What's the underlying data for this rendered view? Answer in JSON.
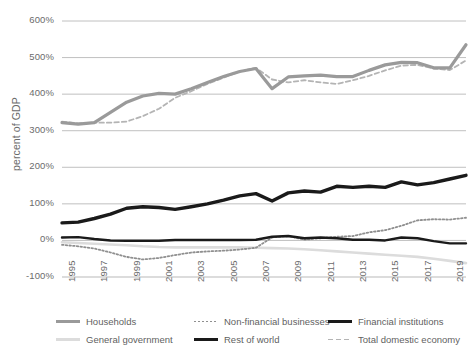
{
  "chart_data": {
    "type": "line",
    "title": "",
    "xlabel": "",
    "ylabel": "percent of GDP",
    "ylim": [
      -100,
      600
    ],
    "xlim": [
      1995,
      2020
    ],
    "grid": true,
    "legend_position": "bottom",
    "ytick_labels": [
      "600%",
      "500%",
      "400%",
      "300%",
      "200%",
      "100%",
      "0%",
      "-100%"
    ],
    "ytick_values": [
      600,
      500,
      400,
      300,
      200,
      100,
      0,
      -100
    ],
    "xtick_labels": [
      "1995",
      "1997",
      "1999",
      "2001",
      "2003",
      "2005",
      "2007",
      "2009",
      "2011",
      "2013",
      "2015",
      "2017",
      "2019"
    ],
    "xtick_values": [
      1995,
      1997,
      1999,
      2001,
      2003,
      2005,
      2007,
      2009,
      2011,
      2013,
      2015,
      2017,
      2019
    ],
    "x": [
      1995,
      1996,
      1997,
      1998,
      1999,
      2000,
      2001,
      2002,
      2003,
      2004,
      2005,
      2006,
      2007,
      2008,
      2009,
      2010,
      2011,
      2012,
      2013,
      2014,
      2015,
      2016,
      2017,
      2018,
      2019,
      2020
    ],
    "series": [
      {
        "name": "Households",
        "color": "#9a9a9a",
        "style": "solid",
        "width": 3.2,
        "values": [
          322,
          318,
          322,
          350,
          378,
          395,
          402,
          400,
          415,
          432,
          448,
          462,
          470,
          415,
          447,
          450,
          452,
          448,
          448,
          465,
          480,
          487,
          486,
          472,
          472,
          535
        ]
      },
      {
        "name": "General government",
        "color": "#dcdcdc",
        "style": "solid",
        "width": 2.6,
        "values": [
          -5,
          -7,
          -9,
          -11,
          -13,
          -16,
          -18,
          -19,
          -19,
          -19,
          -19,
          -19,
          -20,
          -21,
          -22,
          -24,
          -27,
          -30,
          -33,
          -36,
          -39,
          -42,
          -45,
          -50,
          -56,
          -62
        ]
      },
      {
        "name": "Non-financial businesses",
        "color": "#8f8f8f",
        "style": "dotted",
        "width": 1.8,
        "values": [
          -12,
          -16,
          -22,
          -33,
          -45,
          -52,
          -48,
          -40,
          -33,
          -30,
          -28,
          -25,
          -20,
          8,
          12,
          2,
          6,
          10,
          12,
          22,
          28,
          40,
          55,
          58,
          57,
          62
        ]
      },
      {
        "name": "Rest of world",
        "color": "#1a1a1a",
        "style": "solid",
        "width": 3.4,
        "values": [
          48,
          50,
          60,
          72,
          88,
          92,
          90,
          85,
          92,
          100,
          110,
          122,
          128,
          108,
          130,
          135,
          132,
          148,
          145,
          148,
          145,
          160,
          152,
          158,
          168,
          178
        ]
      },
      {
        "name": "Financial institutions",
        "color": "#1a1a1a",
        "style": "solid",
        "width": 2.4,
        "values": [
          8,
          9,
          4,
          0,
          -1,
          -1,
          -1,
          1,
          1,
          1,
          1,
          1,
          2,
          10,
          12,
          6,
          8,
          6,
          2,
          2,
          0,
          8,
          6,
          -2,
          -8,
          -8
        ]
      },
      {
        "name": "Total domestic economy",
        "color": "#b4b4b4",
        "style": "dashed",
        "width": 1.8,
        "values": [
          325,
          320,
          322,
          322,
          325,
          340,
          360,
          390,
          408,
          428,
          445,
          462,
          472,
          440,
          432,
          438,
          432,
          428,
          438,
          450,
          465,
          478,
          480,
          470,
          466,
          492
        ]
      }
    ]
  },
  "legend": {
    "items": [
      {
        "label": "Households",
        "swatch": "legend-swatch-households"
      },
      {
        "label": "Non-financial businesses",
        "swatch": "legend-swatch-nonfinancial"
      },
      {
        "label": "Financial institutions",
        "swatch": "legend-swatch-financial"
      },
      {
        "label": "General government",
        "swatch": "legend-swatch-government"
      },
      {
        "label": "Rest of world",
        "swatch": "legend-swatch-restofworld"
      },
      {
        "label": "Total domestic economy",
        "swatch": "legend-swatch-total"
      }
    ]
  },
  "colors": {
    "background": "#ffffff",
    "grid": "#b9b9b9",
    "text": "#6b6b6b",
    "households": "#9a9a9a",
    "general_government": "#dcdcdc",
    "non_financial_businesses": "#8f8f8f",
    "rest_of_world": "#1a1a1a",
    "financial_institutions": "#1a1a1a",
    "total_domestic_economy": "#b4b4b4"
  }
}
